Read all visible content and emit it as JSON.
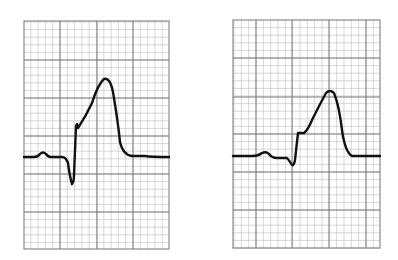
{
  "figure": {
    "grid": {
      "minor_color": "#bdbdbd",
      "major_color": "#7a7a7a",
      "border_color": "#8a8a8a",
      "trace_color": "#111111",
      "minor_per_major": 5
    },
    "panels": [
      {
        "id": "left",
        "x": 24,
        "y": 21,
        "width": 145,
        "height": 228,
        "major_x": [
          60,
          97,
          133
        ],
        "major_y": [
          60,
          98,
          136,
          174,
          212
        ],
        "trace": "M24,157 L34,157 Q38,157 40,154 Q43,151 46,154 Q48,157 51,157 L62,157 Q66,157 68,163 Q70,178 72,184 Q74,182 74,175 L76,126 L77,124 L78,128 Q86,116 92,103 Q98,84 104,79 Q110,77 113,92 Q118,122 120,142 Q123,155 132,156 L145,156 Q150,157 169,157"
      },
      {
        "id": "right",
        "x": 233,
        "y": 20,
        "width": 147,
        "height": 228,
        "major_x": [
          256,
          292,
          329,
          366
        ],
        "major_y": [
          58,
          97,
          134,
          172,
          210
        ],
        "trace": "M233,156 L253,156 Q258,156 262,153 Q266,151 269,154 Q272,158 277,158 L287,158 Q289,160 292,165 Q294,166 295,160 L298,133 L304,133 Q308,130 312,120 Q320,104 326,93 Q330,89 334,93 Q339,105 342,130 Q345,152 352,156 L380,156"
      }
    ]
  }
}
